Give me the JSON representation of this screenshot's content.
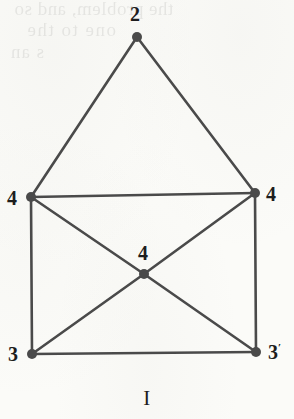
{
  "figure": {
    "caption": "I",
    "ghost_text": {
      "line1": "the problem, and so",
      "line2": "one          to the",
      "line3": "s  an"
    },
    "colors": {
      "paper": "#fbfbf8",
      "ink": "#4a4a4a",
      "label": "#1d1d1d"
    }
  },
  "chart_data": {
    "type": "diagram",
    "title": "I",
    "nodes": [
      {
        "id": "top",
        "label": "2",
        "x": 137,
        "y": 37,
        "label_x": 130,
        "label_y": 4
      },
      {
        "id": "left",
        "label": "4",
        "x": 31,
        "y": 197,
        "label_x": 7,
        "label_y": 188
      },
      {
        "id": "right",
        "label": "4",
        "x": 255,
        "y": 193,
        "label_x": 266,
        "label_y": 184
      },
      {
        "id": "center",
        "label": "4",
        "x": 144,
        "y": 274,
        "label_x": 138,
        "label_y": 243
      },
      {
        "id": "bl",
        "label": "3",
        "x": 32,
        "y": 354,
        "label_x": 8,
        "label_y": 344
      },
      {
        "id": "br",
        "label": "3'",
        "x": 256,
        "y": 352,
        "label_x": 268,
        "label_y": 342
      }
    ],
    "edges": [
      {
        "from": "top",
        "to": "left"
      },
      {
        "from": "top",
        "to": "right"
      },
      {
        "from": "left",
        "to": "right"
      },
      {
        "from": "left",
        "to": "bl"
      },
      {
        "from": "right",
        "to": "br"
      },
      {
        "from": "bl",
        "to": "br"
      },
      {
        "from": "left",
        "to": "center"
      },
      {
        "from": "right",
        "to": "center"
      },
      {
        "from": "bl",
        "to": "center"
      },
      {
        "from": "br",
        "to": "center"
      }
    ],
    "node_radius": 5,
    "edge_width": 2.6,
    "xlim": [
      0,
      294
    ],
    "ylim": [
      0,
      419
    ]
  }
}
